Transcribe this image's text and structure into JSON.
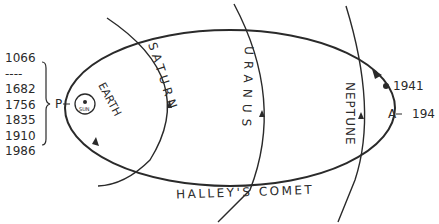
{
  "diagram": {
    "comet_label": "HALLEY'S COMET",
    "perihelion_label": "P",
    "aphelion_label": "A",
    "aphelion_year": "194",
    "position_year": "1941",
    "earth_label": "EARTH",
    "sun_label": "SUN",
    "planets": [
      {
        "name": "SATURN"
      },
      {
        "name": "URANUS"
      },
      {
        "name": "NEPTUNE"
      }
    ],
    "perihelion_years": [
      "1066",
      "----",
      "1682",
      "1756",
      "1835",
      "1910",
      "1986"
    ],
    "line_color": "#2a2a2a",
    "background": "#ffffff"
  }
}
